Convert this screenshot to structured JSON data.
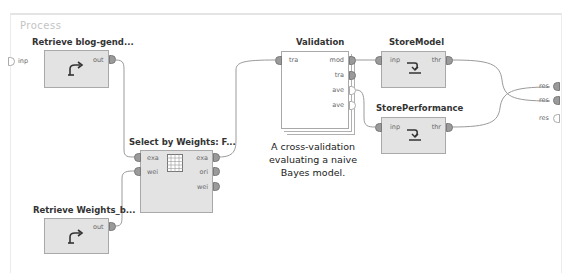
{
  "panel": {
    "title": "Process"
  },
  "process_ports": {
    "input": [
      {
        "label": "inp",
        "connected": false
      }
    ],
    "output": [
      {
        "label": "res",
        "connected": true
      },
      {
        "label": "res",
        "connected": true
      },
      {
        "label": "res",
        "connected": false
      }
    ]
  },
  "operators": {
    "retrieve_blog": {
      "title": "Retrieve blog-gend...",
      "icon": "retrieve-icon",
      "out_ports": [
        "out"
      ]
    },
    "select_by_weights": {
      "title": "Select by Weights: F...",
      "icon": "table-grid-icon",
      "in_ports": [
        "exa",
        "wei"
      ],
      "out_ports": [
        "exa",
        "ori",
        "wei"
      ]
    },
    "retrieve_weights": {
      "title": "Retrieve Weights_b...",
      "icon": "retrieve-icon",
      "out_ports": [
        "out"
      ]
    },
    "validation": {
      "title": "Validation",
      "in_ports": [
        "tra"
      ],
      "out_ports": [
        "mod",
        "tra",
        "ave",
        "ave"
      ],
      "caption": [
        "A cross-validation",
        "evaluating a naive",
        "Bayes model."
      ]
    },
    "store_model": {
      "title": "StoreModel",
      "icon": "store-icon",
      "in_ports": [
        "inp"
      ],
      "out_ports": [
        "thr"
      ]
    },
    "store_performance": {
      "title": "StorePerformance",
      "icon": "store-icon",
      "in_ports": [
        "inp"
      ],
      "out_ports": [
        "thr"
      ]
    }
  },
  "colors": {
    "operator_fill": "#e3e3e3",
    "port_fill": "#9a9a9a",
    "wire": "#9a9a9a",
    "label_faded": "#c4c4c4"
  }
}
